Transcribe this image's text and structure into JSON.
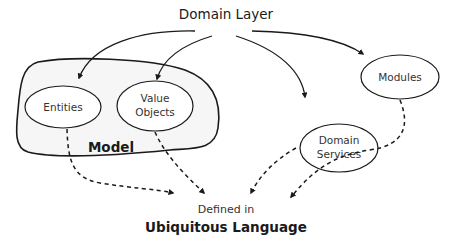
{
  "diagram": {
    "title": "Domain Layer",
    "model_group": {
      "label": "Model",
      "nodes": [
        {
          "id": "entities",
          "label": "Entities"
        },
        {
          "id": "value-objects",
          "label_line1": "Value",
          "label_line2": "Objects"
        }
      ]
    },
    "external_nodes": [
      {
        "id": "domain-services",
        "label_line1": "Domain",
        "label_line2": "Services"
      },
      {
        "id": "modules",
        "label": "Modules"
      }
    ],
    "target": {
      "line1": "Defined in",
      "line2": "Ubiquitous Language"
    },
    "edges": {
      "solid": [
        {
          "from": "Domain Layer",
          "to": "Entities"
        },
        {
          "from": "Domain Layer",
          "to": "Value Objects"
        },
        {
          "from": "Domain Layer",
          "to": "Domain Services"
        },
        {
          "from": "Domain Layer",
          "to": "Modules"
        }
      ],
      "dashed": [
        {
          "from": "Entities",
          "to": "Ubiquitous Language"
        },
        {
          "from": "Value Objects",
          "to": "Ubiquitous Language"
        },
        {
          "from": "Domain Services",
          "to": "Ubiquitous Language"
        },
        {
          "from": "Modules",
          "to": "Ubiquitous Language"
        }
      ]
    },
    "colors": {
      "stroke": "#1a1a1a",
      "model_fill": "#f6f6f6",
      "node_fill": "#ffffff",
      "background": "#ffffff"
    }
  }
}
